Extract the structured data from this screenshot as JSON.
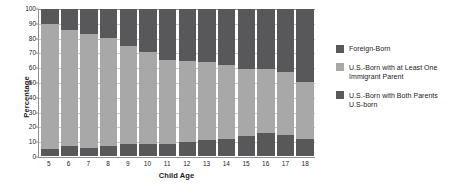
{
  "chart_data": {
    "type": "bar",
    "subtype": "stacked-100-percent",
    "title": "",
    "xlabel": "Child Age",
    "ylabel": "Percentage",
    "categories": [
      "5",
      "6",
      "7",
      "8",
      "9",
      "10",
      "11",
      "12",
      "13",
      "14",
      "15",
      "16",
      "17",
      "18"
    ],
    "ylim": [
      0,
      100
    ],
    "yticks": [
      "0",
      "10",
      "20",
      "30",
      "40",
      "50",
      "60",
      "70",
      "80",
      "90",
      "100"
    ],
    "grid": true,
    "grid_axis": "y",
    "legend_position": "right",
    "stack_order_bottom_to_top": [
      "U.S.-Born with Both Parents U.S-born",
      "U.S.-Born with at Least One Immigrant Parent",
      "Foreign-Born"
    ],
    "series": [
      {
        "name": "U.S.-Born with Both Parents U.S-born",
        "color": "#58585a",
        "values": [
          5,
          6.5,
          5.5,
          7,
          8,
          8,
          8.5,
          9.5,
          11,
          11.5,
          13.5,
          15.5,
          14.5,
          11.5
        ]
      },
      {
        "name": "U.S.-Born with at Least One Immigrant Parent",
        "color": "#a8a8a8",
        "values": [
          85,
          79,
          77.5,
          73,
          67,
          63,
          57,
          55,
          53,
          50.5,
          46,
          43.5,
          42.5,
          39
        ]
      },
      {
        "name": "Foreign-Born",
        "color": "#58585a",
        "values": [
          10,
          14.5,
          17,
          20,
          25,
          29,
          34.5,
          35.5,
          36,
          38,
          40.5,
          41,
          43,
          49.5
        ]
      }
    ],
    "cumulative_tops": {
      "bottom_segment": [
        5,
        6.5,
        5.5,
        7,
        8,
        8,
        8.5,
        9.5,
        11,
        11.5,
        13.5,
        15.5,
        14.5,
        11.5
      ],
      "middle_segment": [
        90,
        85.5,
        83,
        80,
        75,
        71,
        65.5,
        64.5,
        64,
        62,
        59.5,
        59,
        57,
        50.5
      ],
      "top_segment": [
        100,
        100,
        100,
        100,
        100,
        100,
        100,
        100,
        100,
        100,
        100,
        100,
        100,
        100
      ]
    }
  },
  "legend": {
    "items": [
      {
        "label": "Foreign-Born",
        "color": "#58585a"
      },
      {
        "label": "U.S.-Born with at Least One Immigrant Parent",
        "color": "#a8a8a8"
      },
      {
        "label": "U.S.-Born with Both Parents U.S-born",
        "color": "#58585a"
      }
    ]
  },
  "colors": {
    "foreign_born": "#58585a",
    "us_born_one_immigrant_parent": "#a8a8a8",
    "us_born_both_parents": "#58585a",
    "axis": "#8d8d8d",
    "grid": "#c9c9c9",
    "background": "#ffffff",
    "text": "#1a1a1a"
  }
}
